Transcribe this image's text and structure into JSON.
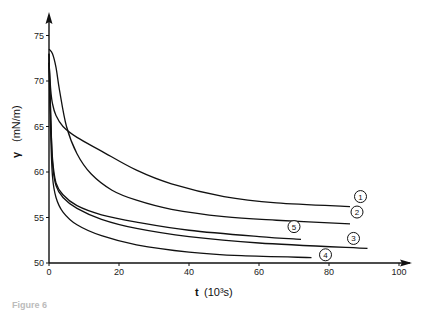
{
  "chart_data": {
    "type": "line",
    "title": "",
    "xlabel": "t (10³s)",
    "ylabel": "γ (mN/m)",
    "xlim": [
      0,
      100
    ],
    "ylim": [
      50,
      76
    ],
    "grid": false,
    "legend_position": "inline circled numbers at curve ends",
    "x_ticks": [
      0,
      20,
      40,
      60,
      80,
      100
    ],
    "y_ticks": [
      50,
      55,
      60,
      65,
      70,
      75
    ],
    "series": [
      {
        "name": "1",
        "x": [
          0,
          0.5,
          1,
          2,
          4,
          8,
          15,
          25,
          35,
          50,
          65,
          86
        ],
        "y": [
          72,
          69,
          67.5,
          66.2,
          65,
          63.8,
          62.3,
          60.2,
          58.7,
          57.3,
          56.6,
          56.2
        ]
      },
      {
        "name": "2",
        "x": [
          0,
          1,
          2,
          3,
          5,
          8,
          12,
          18,
          25,
          35,
          50,
          65,
          86
        ],
        "y": [
          73.5,
          73,
          71.5,
          69,
          65,
          62,
          59.8,
          58,
          56.9,
          55.9,
          55.1,
          54.7,
          54.3
        ]
      },
      {
        "name": "3",
        "x": [
          0,
          0.5,
          1,
          2,
          4,
          8,
          15,
          25,
          40,
          60,
          91
        ],
        "y": [
          73,
          66,
          61,
          58.5,
          57.2,
          56,
          54.8,
          53.8,
          52.9,
          52.2,
          51.6
        ]
      },
      {
        "name": "4",
        "x": [
          0,
          0.5,
          1,
          2,
          4,
          8,
          15,
          25,
          40,
          55,
          75
        ],
        "y": [
          72,
          64,
          59.5,
          57.2,
          55.6,
          54.2,
          53,
          52,
          51.2,
          50.8,
          50.6
        ]
      },
      {
        "name": "5",
        "x": [
          0,
          0.5,
          1,
          2,
          4,
          8,
          15,
          25,
          40,
          60,
          72
        ],
        "y": [
          73,
          66,
          61.5,
          58.8,
          57.5,
          56.3,
          55.3,
          54.5,
          53.6,
          52.9,
          52.6
        ]
      }
    ],
    "labels": [
      {
        "text": "1",
        "x": 89,
        "y": 57.3
      },
      {
        "text": "2",
        "x": 88,
        "y": 55.6
      },
      {
        "text": "3",
        "x": 87,
        "y": 52.7
      },
      {
        "text": "4",
        "x": 79,
        "y": 50.9
      },
      {
        "text": "5",
        "x": 70,
        "y": 54.0
      }
    ]
  },
  "axis": {
    "x_title": "t",
    "x_unit": "(10³s)",
    "y_symbol": "γ",
    "y_unit": "(mN/m)"
  },
  "caption": "Figure 6"
}
